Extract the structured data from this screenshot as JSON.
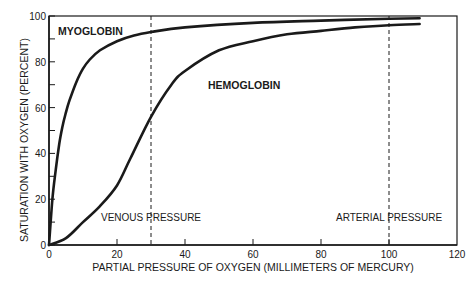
{
  "chart_data": {
    "type": "line",
    "title": "",
    "xlabel": "PARTIAL PRESSURE OF OXYGEN (MILLIMETERS OF MERCURY)",
    "ylabel": "SATURATION WITH OXYGEN (PERCENT)",
    "xlim": [
      0,
      120
    ],
    "ylim": [
      0,
      100
    ],
    "xticks": [
      0,
      20,
      40,
      60,
      80,
      100,
      120
    ],
    "yticks": [
      0,
      20,
      40,
      60,
      80,
      100
    ],
    "grid": false,
    "series": [
      {
        "name": "MYOGLOBIN",
        "x": [
          0,
          1,
          2,
          3,
          4,
          5,
          6,
          8,
          10,
          12,
          15,
          20,
          25,
          30,
          40,
          60,
          80,
          100,
          109
        ],
        "y": [
          0,
          20,
          33,
          44,
          52,
          58,
          63,
          71,
          77,
          81,
          85,
          89,
          91.5,
          93,
          95,
          97,
          98,
          98.8,
          99
        ]
      },
      {
        "name": "HEMOGLOBIN",
        "x": [
          0,
          5,
          10,
          15,
          20,
          24,
          30,
          36,
          40,
          50,
          60,
          70,
          80,
          90,
          100,
          109
        ],
        "y": [
          0,
          3,
          10,
          17,
          26,
          38,
          56,
          70,
          76,
          85,
          89,
          92,
          93.5,
          95,
          96,
          96.5
        ]
      }
    ],
    "annotations": [
      {
        "type": "vline",
        "x": 30,
        "style": "dashed",
        "label": "VENOUS PRESSURE"
      },
      {
        "type": "vline",
        "x": 100,
        "style": "dashed",
        "label": "ARTERIAL PRESSURE"
      }
    ]
  },
  "labels": {
    "myoglobin": "MYOGLOBIN",
    "hemoglobin": "HEMOGLOBIN",
    "venous": "VENOUS PRESSURE",
    "arterial": "ARTERIAL PRESSURE",
    "xlabel": "PARTIAL PRESSURE OF OXYGEN (MILLIMETERS OF MERCURY)",
    "ylabel": "SATURATION WITH OXYGEN (PERCENT)"
  },
  "colors": {
    "ink": "#1a1a1a",
    "background": "#ffffff"
  }
}
